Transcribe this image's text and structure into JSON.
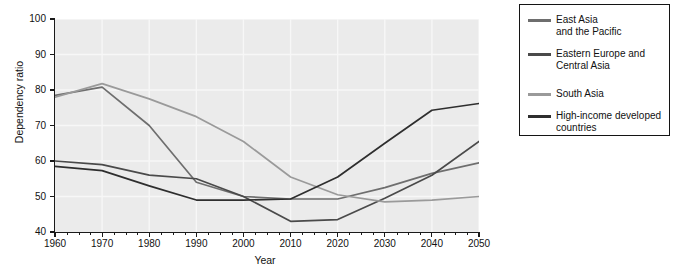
{
  "chart_data": {
    "type": "line",
    "title": "",
    "xlabel": "Year",
    "ylabel": "Dependency ratio",
    "xlim": [
      1960,
      2050
    ],
    "ylim": [
      40,
      100
    ],
    "grid": true,
    "x": [
      1960,
      1970,
      1980,
      1990,
      2000,
      2010,
      2020,
      2030,
      2040,
      2050
    ],
    "x_ticks": [
      "1960",
      "1970",
      "1980",
      "1990",
      "2000",
      "2010",
      "2020",
      "2030",
      "2040",
      "2050"
    ],
    "y_ticks": [
      "40",
      "50",
      "60",
      "70",
      "80",
      "90",
      "100"
    ],
    "minor_tick_step": 2.5,
    "legend_position": "right-outside",
    "series": [
      {
        "name": "East Asia\nand the Pacific",
        "color": "#6e6e6e",
        "values": [
          78.5,
          80.8,
          70.0,
          54.0,
          50.0,
          49.3,
          49.3,
          52.5,
          56.5,
          59.5
        ]
      },
      {
        "name": "Eastern Europe and\nCentral Asia",
        "color": "#4a4a4a",
        "values": [
          60.0,
          59.0,
          56.0,
          55.0,
          50.0,
          43.0,
          43.5,
          49.5,
          56.0,
          65.5
        ]
      },
      {
        "name": "South Asia",
        "color": "#9a9a9a",
        "values": [
          78.0,
          81.8,
          77.5,
          72.5,
          65.5,
          55.5,
          50.5,
          48.5,
          49.0,
          50.0
        ]
      },
      {
        "name": "High-income developed\ncountries",
        "color": "#2e2e2e",
        "values": [
          58.5,
          57.3,
          53.0,
          49.0,
          49.0,
          49.3,
          55.5,
          65.0,
          74.3,
          76.2
        ]
      }
    ]
  },
  "legend": {
    "items": [
      {
        "label": "East Asia\nand the Pacific",
        "color": "#6e6e6e"
      },
      {
        "label": "Eastern Europe and\nCentral Asia",
        "color": "#4a4a4a"
      },
      {
        "label": "South Asia",
        "color": "#9a9a9a"
      },
      {
        "label": "High-income developed\ncountries",
        "color": "#2e2e2e"
      }
    ]
  },
  "axes": {
    "y_title": "Dependency ratio",
    "x_title": "Year"
  },
  "colors": {
    "plot_background": "#ebebeb",
    "gridline": "#f7f7f7",
    "axis": "#1a1a1a",
    "page_background": "#ffffff"
  }
}
